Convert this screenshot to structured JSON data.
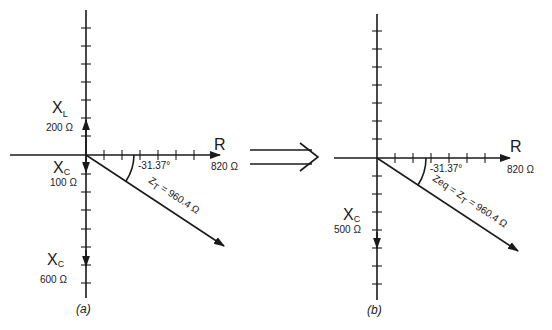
{
  "diagram": {
    "transform_arrow": "double-line arrow indicating (a) simplifies to (b)",
    "panels": [
      {
        "caption": "(a)",
        "R": {
          "symbol": "R",
          "value": "820 Ω"
        },
        "XL": {
          "symbol": "X",
          "subscript": "L",
          "value": "200 Ω"
        },
        "XC_small": {
          "symbol": "X",
          "subscript": "C",
          "value": "100 Ω"
        },
        "XC_large": {
          "symbol": "X",
          "subscript": "C",
          "value": "600 Ω"
        },
        "angle": "-31.37°",
        "impedance": {
          "label": "Z",
          "subscript": "T",
          "text": " = 960.4 Ω"
        }
      },
      {
        "caption": "(b)",
        "R": {
          "symbol": "R",
          "value": "820 Ω"
        },
        "XC": {
          "symbol": "X",
          "subscript": "C",
          "value": "500 Ω"
        },
        "angle": "-31.37°",
        "impedance": {
          "label": "Zeq = Z",
          "subscript": "T",
          "text": " = 960.4 Ω"
        }
      }
    ]
  }
}
